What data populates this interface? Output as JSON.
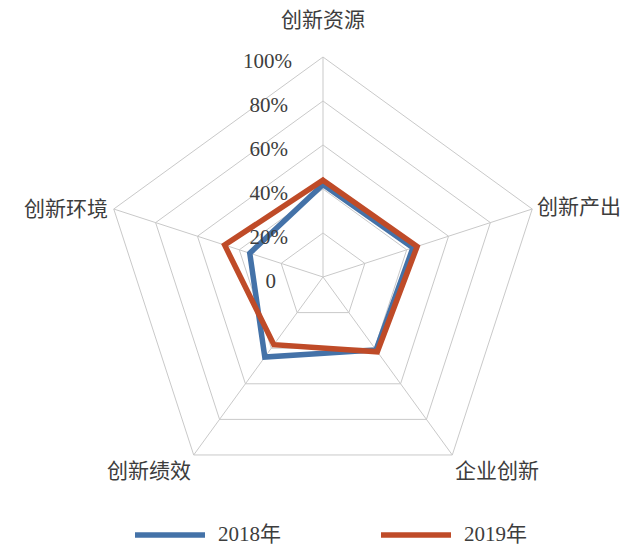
{
  "chart_data": {
    "type": "radar",
    "title": "",
    "categories": [
      "创新资源",
      "创新产出",
      "企业创新",
      "创新绩效",
      "创新环境"
    ],
    "tick_labels": [
      "0",
      "20%",
      "40%",
      "60%",
      "80%",
      "100%"
    ],
    "tick_values": [
      0,
      20,
      40,
      60,
      80,
      100
    ],
    "rmin": 0,
    "rmax": 100,
    "grid": true,
    "legend_position": "bottom",
    "series": [
      {
        "name": "2018年",
        "color": "#4472A8",
        "values": [
          42,
          43,
          41,
          45,
          35
        ]
      },
      {
        "name": "2019年",
        "color": "#BF4B28",
        "values": [
          44,
          45,
          42,
          38,
          47
        ]
      }
    ]
  },
  "axis": {
    "tick_0": "0",
    "tick_20": "20%",
    "tick_40": "40%",
    "tick_60": "60%",
    "tick_80": "80%",
    "tick_100": "100%"
  },
  "categories": {
    "top": "创新资源",
    "right": "创新产出",
    "bottom_right": "企业创新",
    "bottom_left": "创新绩效",
    "left": "创新环境"
  },
  "legend": {
    "items": [
      {
        "label": "2018年",
        "color": "#4472A8"
      },
      {
        "label": "2019年",
        "color": "#BF4B28"
      }
    ]
  }
}
